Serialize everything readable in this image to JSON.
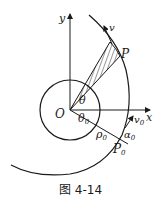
{
  "figure": {
    "caption": "图 4-14",
    "labels": {
      "y_axis": "y",
      "x_axis": "x",
      "origin": "O",
      "point_p": "P",
      "point_p0": "P",
      "point_p0_sub": "0",
      "velocity": "v",
      "velocity0": "v",
      "velocity0_sub": "0",
      "theta": "θ",
      "theta0": "θ",
      "theta0_sub": "0",
      "rho0": "ρ",
      "rho0_sub": "0",
      "alpha0": "α",
      "alpha0_sub": "0"
    },
    "colors": {
      "stroke": "#1a1a1a",
      "background": "#ffffff"
    }
  }
}
